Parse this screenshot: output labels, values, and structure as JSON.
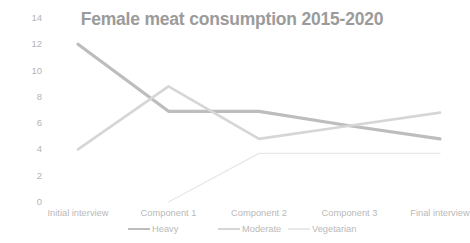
{
  "chart_data": {
    "type": "line",
    "title": "Female meat consumption 2015-2020",
    "xlabel": "",
    "ylabel": "",
    "ylim": [
      0,
      14
    ],
    "yticks": [
      0,
      2,
      4,
      6,
      8,
      10,
      12,
      14
    ],
    "ytick_labels": [
      "0",
      "2",
      "4",
      "6",
      "8",
      "10",
      "12",
      "14"
    ],
    "grid": false,
    "legend_position": "bottom",
    "categories": [
      "Initial interview",
      "Component 1",
      "Component 2",
      "Component 3",
      "Final interview"
    ],
    "series": [
      {
        "name": "Heavy",
        "color": "#bdbdbd",
        "values": [
          12,
          6.9,
          6.9,
          5.8,
          4.8
        ]
      },
      {
        "name": "Moderate",
        "color": "#d6d6d6",
        "values": [
          4,
          8.8,
          4.8,
          5.8,
          6.8
        ]
      },
      {
        "name": "Vegetarian",
        "color": "#e8e8e8",
        "values": [
          null,
          0,
          3.7,
          3.7,
          3.7
        ]
      }
    ]
  },
  "colors": {
    "background": "#ffffff",
    "title": "#9b9b9b",
    "axis_text": "#b9b9b9",
    "series_heavy": "#bdbdbd",
    "series_moderate": "#d6d6d6",
    "series_vegetarian": "#e8e8e8"
  }
}
